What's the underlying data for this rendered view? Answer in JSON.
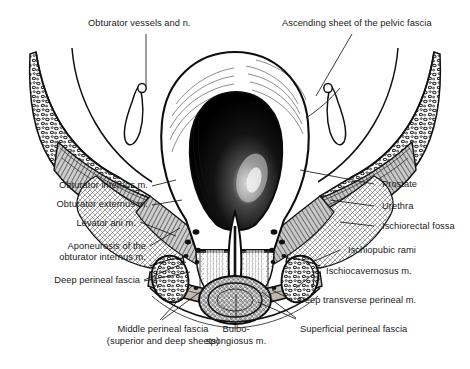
{
  "figure": {
    "background_color": "#ffffff",
    "ink_color": "#1a1a1a",
    "view": "coronal section through the male pelvis at the level of the prostate and urogenital diaphragm"
  },
  "labels": {
    "obturator_vessels": "Obturator vessels and n.",
    "ascending_sheet": "Ascending sheet of the pelvic fascia",
    "obturator_internus": "Obturator internus m.",
    "obturator_externus": "Obturator externus m.",
    "levator_ani": "Levator ani m.",
    "aponeurosis_l1": "Aponeurosis of the",
    "aponeurosis_l2": "obturator internus m.",
    "deep_perineal_fascia": "Deep perineal fascia",
    "prostate": "Prostate",
    "urethra": "Urethra",
    "ischiorectal_fossa": "Ischiorectal fossa",
    "ischiopubic_rami": "Ischiopubic rami",
    "ischiocavernosus": "Ischiocavernosus m.",
    "deep_transverse": "Deep transverse perineal m.",
    "superficial_perineal_fascia": "Superficial perineal fascia",
    "middle_perineal_l1": "Middle perineal fascia",
    "middle_perineal_l2": "(superior and deep sheets)",
    "bulbospongiosus_l1": "Bulbo-",
    "bulbospongiosus_l2": "spongiosus m."
  },
  "structures": {
    "bladder_cavity_color": "#0a0a0a",
    "bone_fill": "#f2f2f2",
    "muscle_fill": "#9a9a9a",
    "fascia_fill": "#c9c4bd"
  }
}
